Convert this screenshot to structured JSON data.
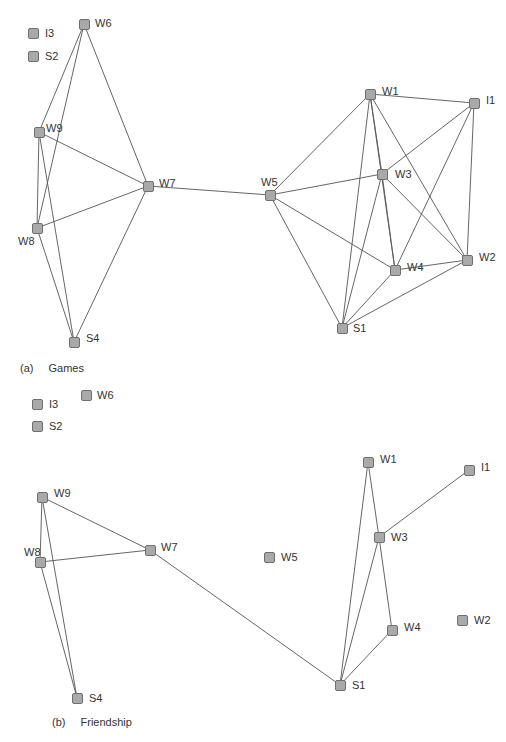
{
  "style": {
    "node_fill": "#a9a9a9",
    "node_border": "#6f6f6f",
    "edge_color": "#555555",
    "text_color": "#333333"
  },
  "panels": [
    {
      "id": "a",
      "caption": {
        "tag": "(a)",
        "title": "Games",
        "x": 20,
        "y": 362
      },
      "nodes": [
        {
          "id": "I3",
          "label": "I3",
          "x": 33,
          "y": 33,
          "lx": 12,
          "ly": -6
        },
        {
          "id": "S2",
          "label": "S2",
          "x": 33,
          "y": 56,
          "lx": 12,
          "ly": -6
        },
        {
          "id": "W6",
          "label": "W6",
          "x": 84,
          "y": 24,
          "lx": 11,
          "ly": -7
        },
        {
          "id": "W9",
          "label": "W9",
          "x": 39,
          "y": 132,
          "lx": 7,
          "ly": -10
        },
        {
          "id": "W7",
          "label": "W7",
          "x": 148,
          "y": 186,
          "lx": 11,
          "ly": -9
        },
        {
          "id": "W8",
          "label": "W8",
          "x": 37,
          "y": 228,
          "lx": -19,
          "ly": 7
        },
        {
          "id": "S4",
          "label": "S4",
          "x": 74,
          "y": 342,
          "lx": 12,
          "ly": -10
        },
        {
          "id": "W5",
          "label": "W5",
          "x": 270,
          "y": 195,
          "lx": -9,
          "ly": -19
        },
        {
          "id": "W1",
          "label": "W1",
          "x": 370,
          "y": 94,
          "lx": 12,
          "ly": -9
        },
        {
          "id": "I1",
          "label": "I1",
          "x": 474,
          "y": 103,
          "lx": 12,
          "ly": -9
        },
        {
          "id": "W3",
          "label": "W3",
          "x": 382,
          "y": 174,
          "lx": 13,
          "ly": -6
        },
        {
          "id": "W4",
          "label": "W4",
          "x": 395,
          "y": 270,
          "lx": 12,
          "ly": -9
        },
        {
          "id": "W2",
          "label": "W2",
          "x": 467,
          "y": 260,
          "lx": 12,
          "ly": -9
        },
        {
          "id": "S1",
          "label": "S1",
          "x": 342,
          "y": 328,
          "lx": 11,
          "ly": -6
        }
      ],
      "edges": [
        [
          "W6",
          "W9"
        ],
        [
          "W6",
          "W8"
        ],
        [
          "W6",
          "W7"
        ],
        [
          "W9",
          "W7"
        ],
        [
          "W9",
          "W8"
        ],
        [
          "W9",
          "S4"
        ],
        [
          "W8",
          "W7"
        ],
        [
          "W8",
          "S4"
        ],
        [
          "W7",
          "S4"
        ],
        [
          "W7",
          "W5"
        ],
        [
          "W5",
          "W1"
        ],
        [
          "W5",
          "W3"
        ],
        [
          "W5",
          "W4"
        ],
        [
          "W5",
          "S1"
        ],
        [
          "W1",
          "I1"
        ],
        [
          "W1",
          "W3"
        ],
        [
          "W1",
          "W4"
        ],
        [
          "W1",
          "S1"
        ],
        [
          "W1",
          "W2"
        ],
        [
          "I1",
          "W3"
        ],
        [
          "I1",
          "W4"
        ],
        [
          "I1",
          "W2"
        ],
        [
          "W3",
          "W4"
        ],
        [
          "W3",
          "S1"
        ],
        [
          "W3",
          "W2"
        ],
        [
          "W4",
          "W2"
        ],
        [
          "W4",
          "S1"
        ],
        [
          "W2",
          "S1"
        ]
      ]
    },
    {
      "id": "b",
      "caption": {
        "tag": "(b)",
        "title": "Friendship",
        "x": 52,
        "y": 716
      },
      "nodes": [
        {
          "id": "I3",
          "label": "I3",
          "x": 37,
          "y": 404,
          "lx": 12,
          "ly": -6
        },
        {
          "id": "S2",
          "label": "S2",
          "x": 37,
          "y": 426,
          "lx": 12,
          "ly": -6
        },
        {
          "id": "W6",
          "label": "W6",
          "x": 86,
          "y": 395,
          "lx": 11,
          "ly": -6
        },
        {
          "id": "W9",
          "label": "W9",
          "x": 42,
          "y": 497,
          "lx": 12,
          "ly": -10
        },
        {
          "id": "W7",
          "label": "W7",
          "x": 150,
          "y": 550,
          "lx": 11,
          "ly": -9
        },
        {
          "id": "W8",
          "label": "W8",
          "x": 40,
          "y": 562,
          "lx": -16,
          "ly": -16
        },
        {
          "id": "S4",
          "label": "S4",
          "x": 77,
          "y": 698,
          "lx": 12,
          "ly": -6
        },
        {
          "id": "W5",
          "label": "W5",
          "x": 269,
          "y": 557,
          "lx": 12,
          "ly": -6
        },
        {
          "id": "W1",
          "label": "W1",
          "x": 368,
          "y": 462,
          "lx": 12,
          "ly": -9
        },
        {
          "id": "I1",
          "label": "I1",
          "x": 469,
          "y": 470,
          "lx": 12,
          "ly": -9
        },
        {
          "id": "W3",
          "label": "W3",
          "x": 379,
          "y": 537,
          "lx": 12,
          "ly": -6
        },
        {
          "id": "W4",
          "label": "W4",
          "x": 392,
          "y": 630,
          "lx": 12,
          "ly": -9
        },
        {
          "id": "W2",
          "label": "W2",
          "x": 462,
          "y": 620,
          "lx": 12,
          "ly": -6
        },
        {
          "id": "S1",
          "label": "S1",
          "x": 340,
          "y": 685,
          "lx": 12,
          "ly": -6
        }
      ],
      "edges": [
        [
          "W9",
          "W7"
        ],
        [
          "W9",
          "W8"
        ],
        [
          "W9",
          "S4"
        ],
        [
          "W8",
          "W7"
        ],
        [
          "W8",
          "S4"
        ],
        [
          "W7",
          "S1"
        ],
        [
          "W1",
          "W3"
        ],
        [
          "W1",
          "S1"
        ],
        [
          "I1",
          "W3"
        ],
        [
          "W3",
          "W4"
        ],
        [
          "W3",
          "S1"
        ],
        [
          "W4",
          "S1"
        ]
      ]
    }
  ]
}
